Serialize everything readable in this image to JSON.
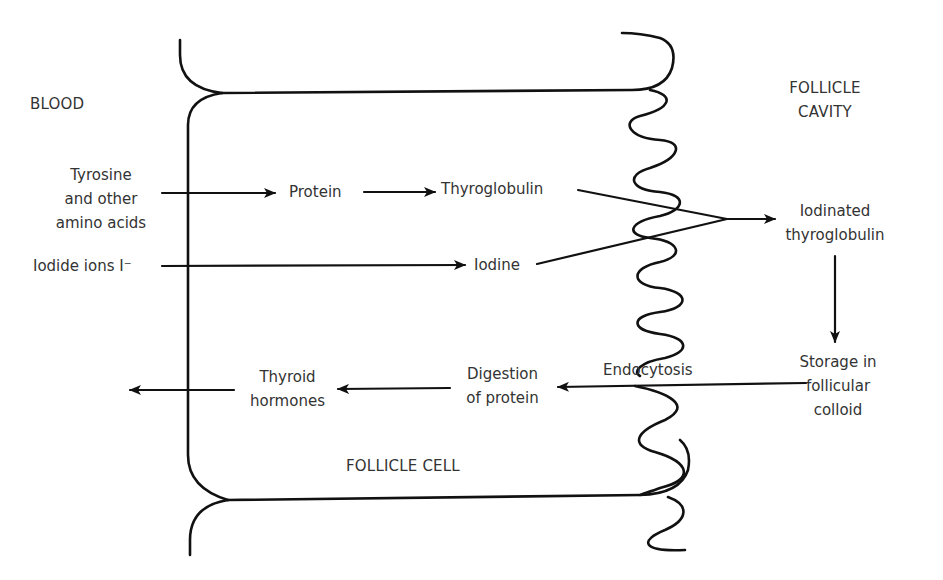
{
  "diagram": {
    "regions": {
      "blood": "BLOOD",
      "follicle_cavity_line1": "FOLLICLE",
      "follicle_cavity_line2": "CAVITY",
      "follicle_cell": "FOLLICLE CELL"
    },
    "nodes": {
      "tyrosine_line1": "Tyrosine",
      "tyrosine_line2": "and other",
      "tyrosine_line3": "amino acids",
      "iodide": "Iodide ions I⁻",
      "protein": "Protein",
      "thyroglobulin": "Thyroglobulin",
      "iodine": "Iodine",
      "iodinated_line1": "Iodinated",
      "iodinated_line2": "thyroglobulin",
      "storage_line1": "Storage in",
      "storage_line2": "follicular",
      "storage_line3": "colloid",
      "endocytosis": "Endocytosis",
      "digestion_line1": "Digestion",
      "digestion_line2": "of protein",
      "hormones_line1": "Thyroid",
      "hormones_line2": "hormones"
    },
    "edges": [
      {
        "from": "Tyrosine and other amino acids",
        "to": "Protein"
      },
      {
        "from": "Protein",
        "to": "Thyroglobulin"
      },
      {
        "from": "Iodide ions I⁻",
        "to": "Iodine"
      },
      {
        "from": "Thyroglobulin + Iodine",
        "to": "Iodinated thyroglobulin"
      },
      {
        "from": "Iodinated thyroglobulin",
        "to": "Storage in follicular colloid"
      },
      {
        "from": "Storage in follicular colloid",
        "to": "Digestion of protein",
        "label": "Endocytosis"
      },
      {
        "from": "Digestion of protein",
        "to": "Thyroid hormones"
      },
      {
        "from": "Thyroid hormones",
        "to": "BLOOD"
      }
    ],
    "colors": {
      "line": "#111111",
      "text": "#333333",
      "background": "#ffffff"
    }
  }
}
